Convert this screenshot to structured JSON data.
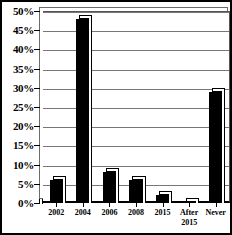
{
  "chart_data": {
    "type": "bar",
    "title": "",
    "subtitle": "",
    "xlabel": "",
    "ylabel": "",
    "categories": [
      "2002",
      "2004",
      "2006",
      "2008",
      "2015",
      "After 2015",
      "Never"
    ],
    "values": [
      6,
      48,
      8,
      6,
      2,
      0.3,
      29
    ],
    "value_labels": [
      "6%",
      "48%",
      "8%",
      "6%",
      "2%",
      "0.3%",
      "29%"
    ],
    "ylim": [
      0,
      50
    ],
    "ytick_values": [
      0,
      5,
      10,
      15,
      20,
      25,
      30,
      35,
      40,
      45,
      50
    ],
    "ytick_labels": [
      "0%",
      "5%",
      "10%",
      "15%",
      "20%",
      "25%",
      "30%",
      "35%",
      "40%",
      "45%",
      "50%"
    ],
    "grid": true,
    "grid_axis": "y",
    "legend": false,
    "legend_position": "none",
    "bar_color": "#000000",
    "grid_color": "#777777",
    "border_color": "#000000",
    "background_color": "#ffffff",
    "series": [
      {
        "name": "",
        "values": [
          6,
          48,
          8,
          6,
          2,
          0.3,
          29
        ]
      }
    ],
    "annotations": []
  }
}
